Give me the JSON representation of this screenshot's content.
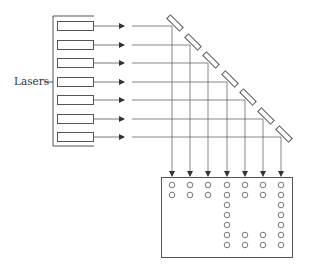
{
  "diagram": {
    "label": "Lasers",
    "stroke_color": "#555555",
    "laser_count": 7,
    "laser_rows_y": [
      26,
      45,
      63,
      82,
      100,
      119,
      137
    ],
    "columns_x": [
      172,
      190,
      208,
      227,
      245,
      263,
      281
    ],
    "screen": {
      "rows": 7,
      "columns": 7,
      "lit_dots": [
        [
          1,
          1,
          1,
          1,
          1,
          1,
          1
        ],
        [
          1,
          1,
          1,
          1,
          1,
          1,
          1
        ],
        [
          0,
          0,
          0,
          1,
          0,
          0,
          1
        ],
        [
          0,
          0,
          0,
          1,
          0,
          0,
          1
        ],
        [
          0,
          0,
          0,
          1,
          0,
          0,
          1
        ],
        [
          0,
          0,
          0,
          1,
          1,
          1,
          1
        ],
        [
          0,
          0,
          0,
          1,
          1,
          1,
          1
        ]
      ]
    }
  }
}
